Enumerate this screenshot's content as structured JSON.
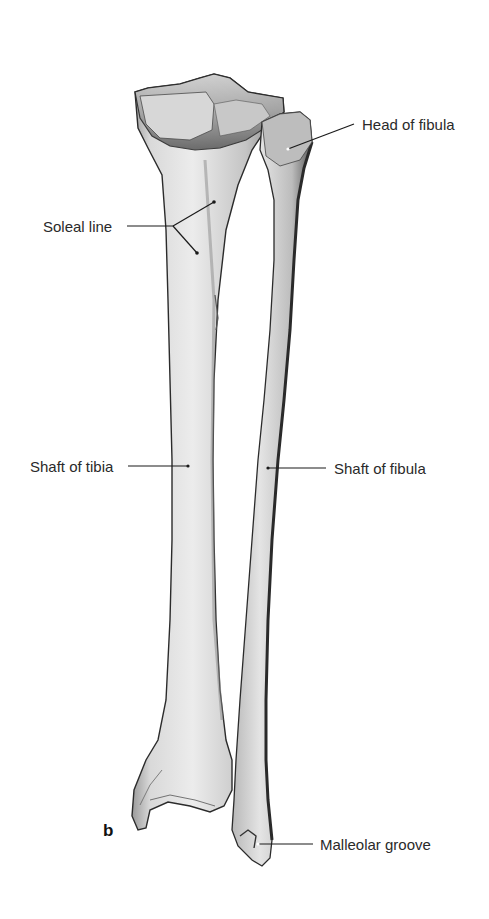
{
  "figure": {
    "panel_letter": "b",
    "labels": [
      {
        "id": "head-of-fibula",
        "text": "Head of fibula"
      },
      {
        "id": "soleal-line",
        "text": "Soleal line"
      },
      {
        "id": "shaft-of-tibia",
        "text": "Shaft of tibia"
      },
      {
        "id": "shaft-of-fibula",
        "text": "Shaft of fibula"
      },
      {
        "id": "malleolar-groove",
        "text": "Malleolar groove"
      }
    ],
    "colors": {
      "background": "#ffffff",
      "text": "#2a2a2a",
      "leader_line": "#1a1a1a",
      "bone_light": "#e6e6e6",
      "bone_mid": "#bdbdbd",
      "bone_dark": "#6e6e6e",
      "outline": "#2b2b2b"
    }
  }
}
